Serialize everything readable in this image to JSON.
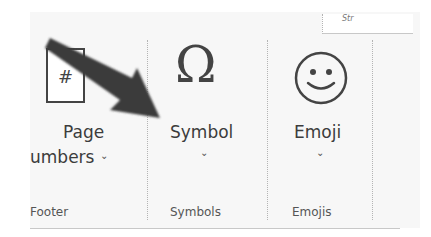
{
  "ribbon": {
    "groups": [
      {
        "name": "Footer",
        "button": {
          "label_line1": "Page",
          "label_line2": "umbers",
          "icon": "page-number-icon",
          "icon_text": "#",
          "has_dropdown": true,
          "chevron": "⌄"
        }
      },
      {
        "name": "Symbols",
        "button": {
          "label": "Symbol",
          "icon": "omega-icon",
          "icon_text": "Ω",
          "has_dropdown": true,
          "chevron": "⌄"
        }
      },
      {
        "name": "Emojis",
        "button": {
          "label": "Emoji",
          "icon": "smiley-icon",
          "has_dropdown": true,
          "chevron": "⌄"
        }
      }
    ],
    "top_panel_text": "Str"
  },
  "annotation": {
    "type": "arrow",
    "points_to": "Symbol",
    "color": "#3a3a3a"
  }
}
